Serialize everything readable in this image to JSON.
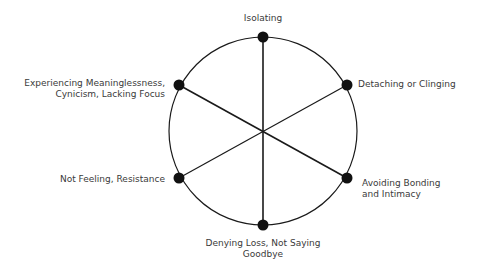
{
  "diagram": {
    "type": "wheel",
    "center": {
      "x": 263,
      "y": 131
    },
    "radius": 94,
    "colors": {
      "line": "#1a1a1a",
      "node": "#111111",
      "text": "#3a3a3a",
      "background": "#ffffff"
    },
    "nodes": [
      {
        "id": "top",
        "label_line1": "Isolating",
        "label_line2": ""
      },
      {
        "id": "right-upper",
        "label_line1": "Detaching or Clinging",
        "label_line2": ""
      },
      {
        "id": "right-lower",
        "label_line1": "Avoiding Bonding",
        "label_line2": "and Intimacy"
      },
      {
        "id": "bottom",
        "label_line1": "Denying Loss, Not Saying",
        "label_line2": "Goodbye"
      },
      {
        "id": "left-lower",
        "label_line1": "Not Feeling, Resistance",
        "label_line2": ""
      },
      {
        "id": "left-upper",
        "label_line1": "Experiencing Meaninglessness,",
        "label_line2": "Cynicism, Lacking Focus"
      }
    ]
  }
}
